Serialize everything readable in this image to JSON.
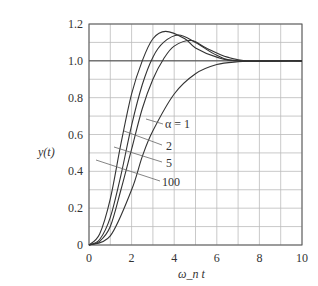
{
  "chart_data": {
    "type": "line",
    "title": "",
    "xlabel": "ω_n t",
    "ylabel": "y(t)",
    "xlim": [
      0,
      10
    ],
    "ylim": [
      0,
      1.2
    ],
    "grid": true,
    "x_ticks": [
      "0",
      "2",
      "4",
      "6",
      "8",
      "10"
    ],
    "y_ticks": [
      "0",
      "0.2",
      "0.4",
      "0.6",
      "0.8",
      "1.0",
      "1.2"
    ],
    "series": [
      {
        "name": "α = 1",
        "x": [
          0,
          1,
          2,
          2.5,
          3,
          4,
          5,
          6,
          7,
          8,
          10
        ],
        "values": [
          0,
          0.05,
          0.3,
          0.48,
          0.62,
          0.82,
          0.93,
          0.98,
          0.995,
          1.0,
          1.0
        ]
      },
      {
        "name": "2",
        "x": [
          0,
          0.5,
          1,
          1.5,
          2,
          2.5,
          3,
          3.5,
          4,
          4.8,
          5.5,
          6.5,
          7.5,
          10
        ],
        "values": [
          0,
          0.02,
          0.1,
          0.3,
          0.52,
          0.74,
          0.9,
          1.01,
          1.08,
          1.11,
          1.07,
          1.02,
          1.0,
          1.0
        ]
      },
      {
        "name": "5",
        "x": [
          0,
          0.5,
          1,
          1.5,
          2,
          2.5,
          3,
          3.5,
          4.2,
          5,
          6,
          7,
          10
        ],
        "values": [
          0,
          0.03,
          0.15,
          0.38,
          0.65,
          0.87,
          1.02,
          1.1,
          1.14,
          1.1,
          1.03,
          1.0,
          1.0
        ]
      },
      {
        "name": "100",
        "x": [
          0,
          0.5,
          1,
          1.5,
          2,
          2.5,
          3,
          3.6,
          4.5,
          5,
          6,
          7,
          10
        ],
        "values": [
          0,
          0.06,
          0.25,
          0.55,
          0.82,
          1.0,
          1.12,
          1.16,
          1.12,
          1.07,
          1.02,
          1.0,
          1.0
        ]
      }
    ],
    "annotations": [
      "α = 1",
      "2",
      "5",
      "100"
    ]
  }
}
